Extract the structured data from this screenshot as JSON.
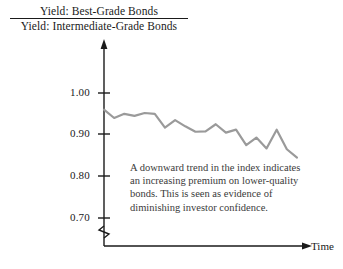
{
  "title": {
    "numerator": "Yield: Best-Grade Bonds",
    "denominator": "Yield: Intermediate-Grade Bonds"
  },
  "annotation": "A downward trend in the index indicates an increasing premium on lower-quality bonds. This is seen as evidence of diminishing investor confidence.",
  "colors": {
    "line": "#9a9a9a",
    "axis": "#1a1a1a",
    "text": "#1a1a1a",
    "annotation_text": "#3a3a3a",
    "background": "#ffffff"
  },
  "axis": {
    "x_label": "Time",
    "y_ticks": [
      "1.00",
      "0.90",
      "0.80",
      "0.70"
    ],
    "y_axis_break": true,
    "x_arrow": true,
    "y_arrow": true
  },
  "chart_data": {
    "type": "line",
    "xlabel": "Time",
    "ylabel": "",
    "grid": false,
    "legend": "none",
    "ylim": [
      0.7,
      1.0
    ],
    "ytick_labels": [
      "0.70",
      "0.80",
      "0.90",
      "1.00"
    ],
    "ytick_values": [
      0.7,
      0.8,
      0.9,
      1.0
    ],
    "xtick_labels": [],
    "axis_break_y": true,
    "series": [
      {
        "name": "Yield ratio (best-grade / intermediate-grade)",
        "x": [
          0,
          1,
          2,
          3,
          4,
          5,
          6,
          7,
          8,
          9,
          10,
          11,
          12,
          13,
          14,
          15,
          16,
          17,
          18,
          19
        ],
        "values": [
          0.96,
          0.94,
          0.95,
          0.945,
          0.952,
          0.95,
          0.917,
          0.935,
          0.92,
          0.907,
          0.908,
          0.925,
          0.905,
          0.912,
          0.875,
          0.893,
          0.867,
          0.912,
          0.865,
          0.845
        ]
      }
    ],
    "annotations": [
      {
        "text": "A downward trend in the index indicates an increasing premium on lower-quality bonds. This is seen as evidence of diminishing investor confidence."
      }
    ]
  }
}
